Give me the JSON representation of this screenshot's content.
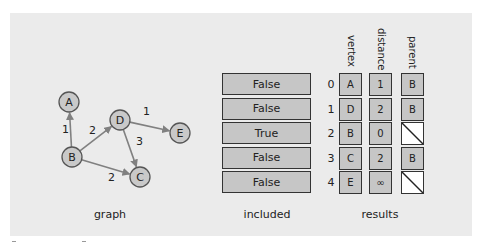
{
  "graph": {
    "caption": "graph",
    "nodes": [
      {
        "id": "A",
        "x": 69,
        "y": 102
      },
      {
        "id": "B",
        "x": 72,
        "y": 157
      },
      {
        "id": "D",
        "x": 120,
        "y": 120
      },
      {
        "id": "E",
        "x": 180,
        "y": 133
      },
      {
        "id": "C",
        "x": 140,
        "y": 177
      }
    ],
    "edges": [
      {
        "from": "B",
        "to": "A",
        "weight": "1",
        "lx": 62,
        "ly": 133
      },
      {
        "from": "B",
        "to": "D",
        "weight": "2",
        "lx": 89,
        "ly": 134
      },
      {
        "from": "D",
        "to": "E",
        "weight": "1",
        "lx": 143,
        "ly": 115
      },
      {
        "from": "D",
        "to": "C",
        "weight": "3",
        "lx": 136,
        "ly": 145
      },
      {
        "from": "B",
        "to": "C",
        "weight": "2",
        "lx": 108,
        "ly": 181
      }
    ]
  },
  "included": {
    "caption": "included",
    "values": [
      "False",
      "False",
      "True",
      "False",
      "False"
    ]
  },
  "results": {
    "caption": "results",
    "headers": {
      "vertex": "vertex",
      "distance": "distance",
      "parent": "parent"
    },
    "rows": [
      {
        "index": "0",
        "vertex": "A",
        "distance": "1",
        "parent": "B"
      },
      {
        "index": "1",
        "vertex": "D",
        "distance": "2",
        "parent": "B"
      },
      {
        "index": "2",
        "vertex": "B",
        "distance": "0",
        "parent": null
      },
      {
        "index": "3",
        "vertex": "C",
        "distance": "2",
        "parent": "B"
      },
      {
        "index": "4",
        "vertex": "E",
        "distance": "∞",
        "parent": null
      }
    ]
  },
  "colors": {
    "panel_bg": "#ebebeb",
    "box_fill": "#c6c6c6",
    "box_border": "#333333",
    "node_fill": "#c9c9c9",
    "edge": "#808080"
  }
}
